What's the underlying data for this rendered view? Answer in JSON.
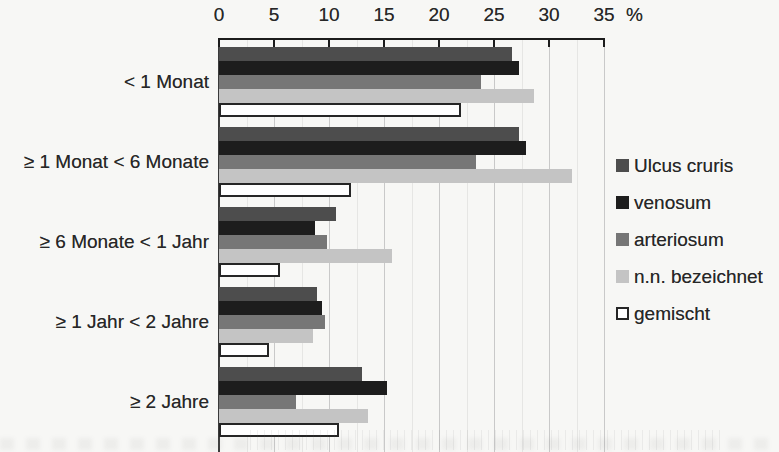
{
  "page": {
    "background": "#f7f7f5"
  },
  "chart_data": {
    "type": "bar",
    "orientation": "horizontal",
    "title": "",
    "xlabel": "",
    "ylabel": "",
    "unit_label": "%",
    "axis": {
      "min": 0,
      "max": 35,
      "tick_step": 5,
      "ticks": [
        0,
        5,
        10,
        15,
        20,
        25,
        30,
        35
      ]
    },
    "categories": [
      "< 1 Monat",
      "≥ 1 Monat < 6 Monate",
      "≥ 6 Monate < 1 Jahr",
      "≥ 1 Jahr < 2 Jahre",
      "≥ 2 Jahre"
    ],
    "series": [
      {
        "name": "Ulcus cruris",
        "color": "#4d4d4d",
        "border": "",
        "values": [
          26.6,
          27.3,
          10.6,
          8.9,
          13.0
        ]
      },
      {
        "name": "venosum",
        "color": "#1d1d1d",
        "border": "",
        "values": [
          27.3,
          27.9,
          8.7,
          9.4,
          15.3
        ]
      },
      {
        "name": "arteriosum",
        "color": "#767676",
        "border": "",
        "values": [
          23.8,
          23.4,
          9.8,
          9.6,
          7.0
        ]
      },
      {
        "name": "n.n. bezeichnet",
        "color": "#c4c4c4",
        "border": "",
        "values": [
          28.6,
          32.1,
          15.7,
          8.5,
          13.5
        ]
      },
      {
        "name": "gemischt",
        "color": "#ffffff",
        "border": "#262626",
        "values": [
          22.0,
          12.0,
          5.5,
          4.5,
          10.9
        ]
      }
    ],
    "legend_position": "right",
    "grid": {
      "major_color": "#c9c9c9",
      "minor_color": "#e6e6e4",
      "minor_step": 2.5
    },
    "axis_color": "#1c1c1c",
    "text_color": "#272727"
  }
}
